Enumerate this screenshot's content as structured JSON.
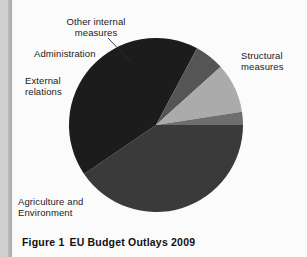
{
  "figure": {
    "caption_prefix": "Figure 1",
    "caption_title": "EU Budget Outlays 2009"
  },
  "labels": {
    "other_internal": "Other internal\nmeasures",
    "administration": "Administration",
    "external_relations": "External\nrelations",
    "agriculture_environment": "Agriculture and\nEnvironment",
    "structural_measures": "Structural\nmeasures"
  },
  "colors": {
    "structural": "#3a3a3a",
    "agriculture": "#1c1c1c",
    "external": "#555555",
    "administration": "#ababab",
    "other_internal": "#6e6e6e",
    "page_background": "#fbfbfb",
    "gutter": "#cfcfcf",
    "text": "#1a1a1a",
    "leader_line": "#2a2a2a"
  },
  "chart_data": {
    "type": "pie",
    "title": "EU Budget Outlays 2009",
    "xlabel": "",
    "ylabel": "",
    "categories": [
      "Structural measures",
      "Agriculture and Environment",
      "External relations",
      "Administration",
      "Other internal measures"
    ],
    "values": [
      33,
      34.5,
      4.5,
      7.5,
      2
    ],
    "units": "percent of total outlays",
    "colors": [
      "#3a3a3a",
      "#1c1c1c",
      "#555555",
      "#ababab",
      "#6e6e6e"
    ],
    "legend": "none (direct slice labels with leader line)",
    "grid": false,
    "start_angle_deg": 0,
    "direction": "clockwise",
    "center_px": [
      156,
      125
    ],
    "radius_px": 87,
    "slices": [
      {
        "name": "Structural measures",
        "value": 33,
        "color": "#3a3a3a",
        "start_deg": 0,
        "end_deg": 118.8
      },
      {
        "name": "Agriculture and Environment",
        "value": 34.5,
        "color": "#1c1c1c",
        "start_deg": 118.8,
        "end_deg": 243.0
      },
      {
        "name": "External relations",
        "value": 4.5,
        "color": "#555555",
        "start_deg": 243.0,
        "end_deg": 259.2
      },
      {
        "name": "Administration",
        "value": 7.5,
        "color": "#ababab",
        "start_deg": 259.2,
        "end_deg": 286.2
      },
      {
        "name": "Other internal measures",
        "value": 2,
        "color": "#6e6e6e",
        "start_deg": 286.2,
        "end_deg": 293.4
      }
    ]
  }
}
